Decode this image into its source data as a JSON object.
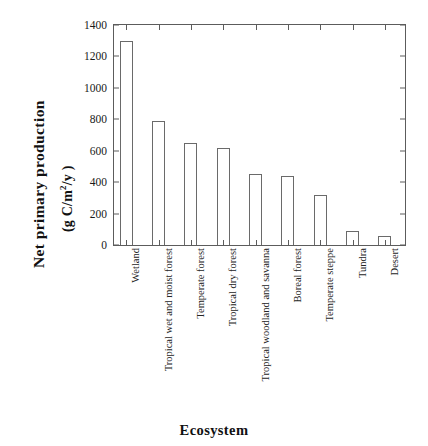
{
  "chart_data": {
    "type": "bar",
    "title": "",
    "xlabel": "Ecosystem",
    "ylabel": "Net primary production",
    "ylabel_units": "(g C/m2/y)",
    "categories": [
      "Wetland",
      "Tropical wet and moist forest",
      "Temperate forest",
      "Tropical dry forest",
      "Tropical woodland and savanna",
      "Boreal forest",
      "Temperate steppe",
      "Tundra",
      "Desert"
    ],
    "values": [
      1300,
      790,
      650,
      620,
      450,
      440,
      320,
      90,
      60
    ],
    "ylim": [
      0,
      1400
    ],
    "yticks": [
      0,
      200,
      400,
      600,
      800,
      1000,
      1200,
      1400
    ],
    "ytick_labels": [
      "0",
      "200",
      "400",
      "600",
      "800",
      "1000",
      "1200",
      "1400"
    ],
    "grid": false,
    "legend": "none",
    "bar_fill_color": "#ffffff",
    "bar_edge_color": "#6a6a6a",
    "axis_color": "#5c5c5c"
  },
  "axis": {
    "y_title_main": "Net primary production",
    "y_title_units_prefix": "(g C/m",
    "y_title_units_sup": "2",
    "y_title_units_suffix": "/y )",
    "x_title": "Ecosystem"
  }
}
